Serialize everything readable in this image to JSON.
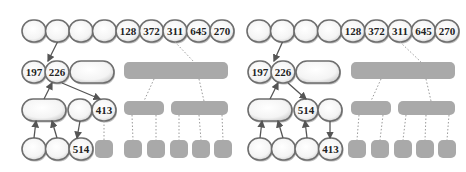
{
  "panels": [
    {
      "name": "before",
      "top_row": [
        "",
        "",
        "",
        "",
        "128",
        "372",
        "311",
        "645",
        "270"
      ],
      "level1": {
        "keys": [
          "197",
          "226"
        ],
        "empty_slot": true
      },
      "level2_left": {
        "wide_empty": true,
        "mid": "",
        "right": "413"
      },
      "level3_left": [
        "",
        "",
        "514"
      ]
    },
    {
      "name": "after",
      "top_row": [
        "",
        "",
        "",
        "",
        "128",
        "372",
        "311",
        "645",
        "270"
      ],
      "level1": {
        "keys": [
          "197",
          "226"
        ],
        "empty_slot": true
      },
      "level2_left": {
        "wide_empty": true,
        "mid": "514",
        "right": ""
      },
      "level3_left": [
        "",
        "",
        "",
        "413"
      ]
    }
  ],
  "colors": {
    "node_fill": "#ffffff",
    "node_border": "#6e6e6e",
    "grey_block": "#a9a9a9",
    "arrow": "#555555",
    "dotted": "#9a9a9a"
  }
}
